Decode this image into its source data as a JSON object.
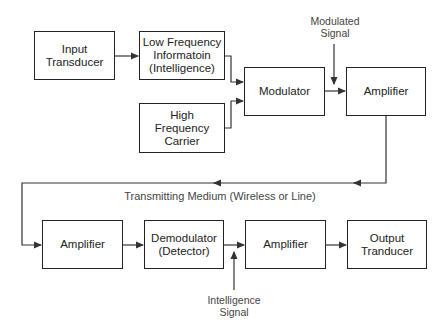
{
  "diagram": {
    "blocks": [
      {
        "id": "input-transducer",
        "label": "Input\nTransducer"
      },
      {
        "id": "low-frequency-info",
        "label": "Low Frequency\nInformatoin\n(Intelligence)"
      },
      {
        "id": "high-frequency-carrier",
        "label": "High\nFrequency\nCarrier"
      },
      {
        "id": "modulator",
        "label": "Modulator"
      },
      {
        "id": "tx-amplifier",
        "label": "Amplifier"
      },
      {
        "id": "rx-amplifier",
        "label": "Amplifier"
      },
      {
        "id": "demodulator",
        "label": "Demodulator\n(Detector)"
      },
      {
        "id": "audio-amplifier",
        "label": "Amplifier"
      },
      {
        "id": "output-transducer",
        "label": "Output\nTranducer"
      }
    ],
    "annotations": {
      "modulated_signal": "Modulated\nSignal",
      "transmitting_medium": "Transmitting Medium (Wireless or Line)",
      "intelligence_signal": "Intelligence\nSignal"
    },
    "connections": [
      [
        "input-transducer",
        "low-frequency-info"
      ],
      [
        "low-frequency-info",
        "modulator"
      ],
      [
        "high-frequency-carrier",
        "modulator"
      ],
      [
        "modulator",
        "tx-amplifier"
      ],
      [
        "tx-amplifier",
        "rx-amplifier"
      ],
      [
        "rx-amplifier",
        "demodulator"
      ],
      [
        "demodulator",
        "audio-amplifier"
      ],
      [
        "audio-amplifier",
        "output-transducer"
      ]
    ],
    "colors": {
      "line": "#222222",
      "text": "#222222",
      "annotation": "#444444"
    }
  }
}
